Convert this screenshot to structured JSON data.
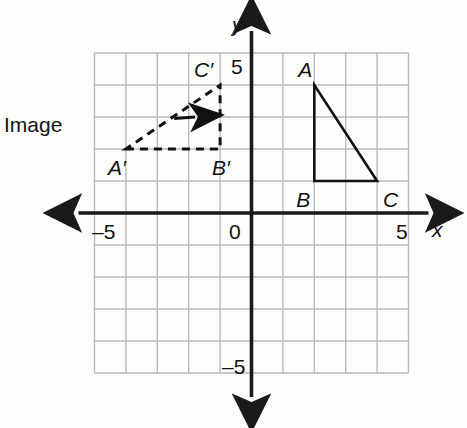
{
  "figure": {
    "type": "coordinate-plane-diagram",
    "background_color": "#fdfdfc",
    "grid_color": "#b9b9b9",
    "axis_color": "#1a1a1a",
    "shape_color": "#111111"
  },
  "axes": {
    "x_label": "x",
    "y_label": "y",
    "origin_label": "0",
    "x_tick_negative": "–5",
    "x_tick_positive": "5",
    "y_tick_positive": "5",
    "y_tick_negative": "–5",
    "x_range": [
      -5,
      5
    ],
    "y_range": [
      -5,
      5
    ],
    "grid_step": 1
  },
  "callout": {
    "text": "Image",
    "leader_from": [
      -5.2,
      2.95
    ],
    "leader_to": [
      -1.8,
      3.0
    ]
  },
  "shapes": [
    {
      "name": "preimage-triangle",
      "style": "solid",
      "vertices": [
        {
          "label": "A",
          "x": 2,
          "y": 4,
          "label_dx": -16,
          "label_dy": -26
        },
        {
          "label": "B",
          "x": 2,
          "y": 1,
          "label_dx": -18,
          "label_dy": 8
        },
        {
          "label": "C",
          "x": 4,
          "y": 1,
          "label_dx": 6,
          "label_dy": 8
        }
      ]
    },
    {
      "name": "image-triangle",
      "style": "dashed",
      "vertices": [
        {
          "label": "A′",
          "x": -4,
          "y": 2,
          "label_dx": -18,
          "label_dy": 8
        },
        {
          "label": "B′",
          "x": -1,
          "y": 2,
          "label_dx": -8,
          "label_dy": 8
        },
        {
          "label": "C′",
          "x": -1,
          "y": 4,
          "label_dx": -26,
          "label_dy": -26
        }
      ]
    }
  ],
  "chart_data": {
    "type": "scatter",
    "title": "",
    "xlabel": "x",
    "ylabel": "y",
    "xlim": [
      -5,
      5
    ],
    "ylim": [
      -5,
      5
    ],
    "grid": true,
    "legend": "none",
    "series": [
      {
        "name": "Triangle ABC (preimage, solid)",
        "points": [
          {
            "label": "A",
            "x": 2,
            "y": 4
          },
          {
            "label": "B",
            "x": 2,
            "y": 1
          },
          {
            "label": "C",
            "x": 4,
            "y": 1
          }
        ]
      },
      {
        "name": "Triangle A'B'C' (image, dashed)",
        "points": [
          {
            "label": "A′",
            "x": -4,
            "y": 2
          },
          {
            "label": "B′",
            "x": -1,
            "y": 2
          },
          {
            "label": "C′",
            "x": -1,
            "y": 4
          }
        ]
      }
    ],
    "annotations": [
      {
        "text": "Image",
        "x": -5.2,
        "y": 2.95
      }
    ]
  }
}
